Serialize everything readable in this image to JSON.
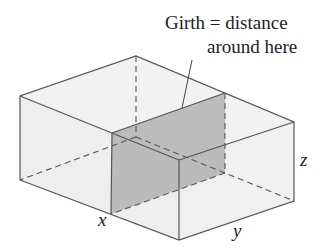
{
  "annotation": {
    "line1": "Girth = distance",
    "line2": "around here"
  },
  "dimensions": {
    "x": "x",
    "y": "y",
    "z": "z"
  },
  "colors": {
    "box_fill": "#ededed",
    "section_fill": "#a9a9a9",
    "edge": "#555555"
  }
}
